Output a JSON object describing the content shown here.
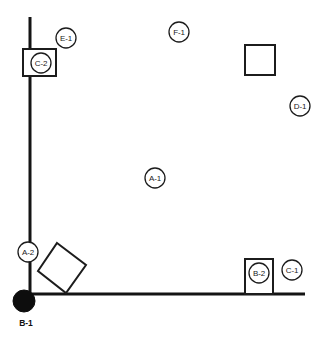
{
  "diagram": {
    "type": "line-drawing",
    "background_color": "#ffffff",
    "line_color": "#141414",
    "fill_color": "#ffffff",
    "marker_fill_color": "#0d0d0d",
    "width": 328,
    "height": 343
  },
  "walls": [
    {
      "name": "vertical-wall",
      "x1": 30,
      "y1": 17,
      "x2": 30,
      "y2": 294
    },
    {
      "name": "horizontal-wall",
      "x1": 30,
      "y1": 294,
      "x2": 305,
      "y2": 294
    }
  ],
  "shapes": [
    {
      "name": "empty-square",
      "kind": "square",
      "x": 245,
      "y": 45,
      "width": 30,
      "height": 30
    },
    {
      "name": "diamond",
      "kind": "rotated-square",
      "points": "57,243 86,265 66,293 38,271"
    }
  ],
  "boxed_callouts": [
    {
      "name": "c2",
      "label": "C-2",
      "box_x": 23,
      "box_y": 49,
      "box_width": 33,
      "box_height": 27,
      "circle_cx": 41,
      "circle_cy": 63,
      "circle_r": 10
    },
    {
      "name": "b2",
      "label": "B-2",
      "box_x": 245,
      "box_y": 259,
      "box_width": 28,
      "box_height": 35,
      "circle_cx": 259,
      "circle_cy": 273,
      "circle_r": 10
    }
  ],
  "callouts": [
    {
      "name": "e1",
      "label": "E-1",
      "cx": 66,
      "cy": 38,
      "r": 10
    },
    {
      "name": "f1",
      "label": "F-1",
      "cx": 179,
      "cy": 32,
      "r": 10
    },
    {
      "name": "d1",
      "label": "D-1",
      "cx": 300,
      "cy": 106,
      "r": 10
    },
    {
      "name": "a1",
      "label": "A-1",
      "cx": 155,
      "cy": 178,
      "r": 10
    },
    {
      "name": "a2",
      "label": "A-2",
      "cx": 28,
      "cy": 252,
      "r": 10
    },
    {
      "name": "c1",
      "label": "C-1",
      "cx": 292,
      "cy": 270,
      "r": 10
    }
  ],
  "markers": [
    {
      "name": "b1",
      "label": "B-1",
      "cx": 24,
      "cy": 301,
      "r": 11,
      "label_x": 26,
      "label_y": 323
    }
  ]
}
